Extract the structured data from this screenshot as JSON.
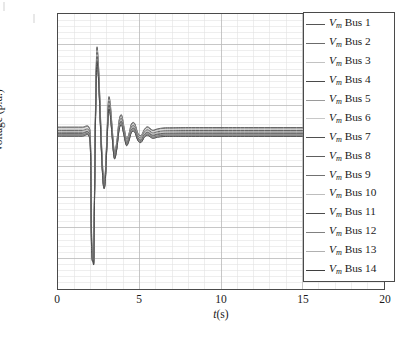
{
  "figure": {
    "background_color": "#ffffff",
    "frame_color": "#4a4a4a",
    "major_grid_color": "#b9b9b9",
    "minor_grid_color": "#e2e2e2"
  },
  "axes": {
    "y": {
      "label": "Voltage (p.u.)",
      "ticks": [
        "0",
        "0.2",
        "0.4",
        "0.6",
        "0.8",
        "1",
        "1.2",
        "1.4",
        "1.6",
        "1.8"
      ],
      "tick_values": [
        0,
        0.2,
        0.4,
        0.6,
        0.8,
        1.0,
        1.2,
        1.4,
        1.6,
        1.8
      ],
      "limits": [
        0,
        1.8
      ],
      "minor_per_major": 5
    },
    "x": {
      "label_prefix": "t",
      "label_suffix": "(s)",
      "ticks": [
        "0",
        "5",
        "10",
        "15",
        "20"
      ],
      "tick_values": [
        0,
        5,
        10,
        15,
        20
      ],
      "limits": [
        0,
        20
      ],
      "minor_per_major": 5
    }
  },
  "legend": {
    "position": "top-right",
    "entries": [
      {
        "label_prefix": "V",
        "label_sub": "m",
        "label_suffix": " Bus 1",
        "color": "#555555"
      },
      {
        "label_prefix": "V",
        "label_sub": "m",
        "label_suffix": " Bus 2",
        "color": "#6b6b6b"
      },
      {
        "label_prefix": "V",
        "label_sub": "m",
        "label_suffix": " Bus 3",
        "color": "#c2c2c2"
      },
      {
        "label_prefix": "V",
        "label_sub": "m",
        "label_suffix": " Bus 4",
        "color": "#4a4a4a"
      },
      {
        "label_prefix": "V",
        "label_sub": "m",
        "label_suffix": " Bus 5",
        "color": "#9a9a9a"
      },
      {
        "label_prefix": "V",
        "label_sub": "m",
        "label_suffix": " Bus 6",
        "color": "#c8c8c8"
      },
      {
        "label_prefix": "V",
        "label_sub": "m",
        "label_suffix": " Bus 7",
        "color": "#4f4f4f"
      },
      {
        "label_prefix": "V",
        "label_sub": "m",
        "label_suffix": " Bus 8",
        "color": "#5e5e5e"
      },
      {
        "label_prefix": "V",
        "label_sub": "m",
        "label_suffix": " Bus 9",
        "color": "#717171"
      },
      {
        "label_prefix": "V",
        "label_sub": "m",
        "label_suffix": " Bus 10",
        "color": "#bdbdbd"
      },
      {
        "label_prefix": "V",
        "label_sub": "m",
        "label_suffix": " Bus 11",
        "color": "#4c4c4c"
      },
      {
        "label_prefix": "V",
        "label_sub": "m",
        "label_suffix": " Bus 12",
        "color": "#808080"
      },
      {
        "label_prefix": "V",
        "label_sub": "m",
        "label_suffix": " Bus 13",
        "color": "#b0b0b0"
      },
      {
        "label_prefix": "V",
        "label_sub": "m",
        "label_suffix": " Bus 14",
        "color": "#3f3f3f"
      }
    ]
  },
  "caption": "",
  "chart_data": {
    "type": "line",
    "title": "",
    "xlabel": "t(s)",
    "ylabel": "Voltage (p.u.)",
    "xlim": [
      0,
      20
    ],
    "ylim": [
      0,
      1.8
    ],
    "grid": true,
    "legend_position": "top-right",
    "event_markers": {
      "fault_start_s": 2.0,
      "fault_clear_s": 2.2,
      "min_voltage_pu": 0.2,
      "max_voltage_pu": 1.61,
      "settling_time_s": 7.0,
      "steady_state_band_pu": [
        1.0,
        1.06
      ],
      "prefault_band_pu": [
        1.01,
        1.07
      ]
    },
    "x": [
      0,
      0.5,
      1.0,
      1.5,
      1.9,
      2.0,
      2.05,
      2.1,
      2.15,
      2.2,
      2.25,
      2.3,
      2.35,
      2.4,
      2.5,
      2.6,
      2.7,
      2.8,
      2.9,
      3.0,
      3.1,
      3.2,
      3.3,
      3.45,
      3.6,
      3.75,
      3.9,
      4.05,
      4.2,
      4.35,
      4.5,
      4.7,
      4.9,
      5.1,
      5.3,
      5.5,
      5.8,
      6.1,
      6.5,
      7.0,
      8.0,
      10.0,
      12.0,
      15.0,
      18.0,
      20.0
    ],
    "series": [
      {
        "name": "V_m Bus 1",
        "color": "#555555",
        "values": [
          1.06,
          1.06,
          1.06,
          1.06,
          1.06,
          0.94,
          0.43,
          0.235,
          0.225,
          0.238,
          0.76,
          1.18,
          1.47,
          1.585,
          1.43,
          1.15,
          0.88,
          0.72,
          0.76,
          1.0,
          1.245,
          1.22,
          1.09,
          0.905,
          0.96,
          1.105,
          1.14,
          1.06,
          0.985,
          1.015,
          1.08,
          1.085,
          1.02,
          1.005,
          1.045,
          1.062,
          1.04,
          1.048,
          1.055,
          1.056,
          1.057,
          1.057,
          1.057,
          1.057,
          1.057,
          1.057
        ]
      },
      {
        "name": "V_m Bus 2",
        "color": "#6b6b6b",
        "values": [
          1.055,
          1.055,
          1.055,
          1.055,
          1.055,
          0.935,
          0.42,
          0.23,
          0.222,
          0.234,
          0.752,
          1.172,
          1.462,
          1.578,
          1.424,
          1.144,
          0.874,
          0.715,
          0.756,
          0.996,
          1.238,
          1.214,
          1.085,
          0.901,
          0.956,
          1.1,
          1.135,
          1.056,
          0.982,
          1.012,
          1.076,
          1.081,
          1.017,
          1.002,
          1.042,
          1.058,
          1.037,
          1.045,
          1.051,
          1.052,
          1.053,
          1.053,
          1.053,
          1.053,
          1.053,
          1.053
        ]
      },
      {
        "name": "V_m Bus 3",
        "color": "#c2c2c2",
        "values": [
          1.045,
          1.045,
          1.045,
          1.045,
          1.045,
          0.922,
          0.4,
          0.222,
          0.215,
          0.226,
          0.735,
          1.155,
          1.445,
          1.56,
          1.408,
          1.13,
          0.862,
          0.704,
          0.746,
          0.986,
          1.225,
          1.2,
          1.074,
          0.893,
          0.948,
          1.09,
          1.124,
          1.047,
          0.975,
          1.005,
          1.067,
          1.072,
          1.009,
          0.996,
          1.034,
          1.049,
          1.029,
          1.036,
          1.042,
          1.043,
          1.044,
          1.044,
          1.044,
          1.044,
          1.044,
          1.044
        ]
      },
      {
        "name": "V_m Bus 4",
        "color": "#4a4a4a",
        "values": [
          1.038,
          1.038,
          1.038,
          1.038,
          1.038,
          0.912,
          0.385,
          0.216,
          0.21,
          0.22,
          0.722,
          1.142,
          1.432,
          1.548,
          1.396,
          1.12,
          0.853,
          0.696,
          0.738,
          0.978,
          1.215,
          1.19,
          1.065,
          0.887,
          0.942,
          1.082,
          1.116,
          1.04,
          0.969,
          0.999,
          1.06,
          1.065,
          1.003,
          0.99,
          1.027,
          1.042,
          1.022,
          1.029,
          1.035,
          1.036,
          1.037,
          1.037,
          1.037,
          1.037,
          1.037,
          1.037
        ]
      },
      {
        "name": "V_m Bus 5",
        "color": "#9a9a9a",
        "values": [
          1.032,
          1.032,
          1.032,
          1.032,
          1.032,
          0.904,
          0.372,
          0.212,
          0.206,
          0.215,
          0.712,
          1.132,
          1.422,
          1.538,
          1.386,
          1.112,
          0.846,
          0.69,
          0.732,
          0.971,
          1.206,
          1.182,
          1.058,
          0.882,
          0.937,
          1.075,
          1.109,
          1.034,
          0.964,
          0.994,
          1.054,
          1.059,
          0.998,
          0.985,
          1.021,
          1.036,
          1.016,
          1.023,
          1.029,
          1.03,
          1.031,
          1.031,
          1.031,
          1.031,
          1.031,
          1.031
        ]
      },
      {
        "name": "V_m Bus 6",
        "color": "#c8c8c8",
        "values": [
          1.027,
          1.027,
          1.027,
          1.027,
          1.027,
          0.897,
          0.362,
          0.208,
          0.202,
          0.211,
          0.704,
          1.124,
          1.414,
          1.53,
          1.378,
          1.105,
          0.84,
          0.685,
          0.727,
          0.965,
          1.199,
          1.175,
          1.052,
          0.877,
          0.932,
          1.069,
          1.103,
          1.029,
          0.96,
          0.99,
          1.049,
          1.054,
          0.993,
          0.981,
          1.016,
          1.031,
          1.011,
          1.018,
          1.024,
          1.025,
          1.026,
          1.026,
          1.026,
          1.026,
          1.026,
          1.026
        ]
      },
      {
        "name": "V_m Bus 7",
        "color": "#4f4f4f",
        "values": [
          1.022,
          1.022,
          1.022,
          1.022,
          1.022,
          0.89,
          0.352,
          0.205,
          0.199,
          0.208,
          0.697,
          1.117,
          1.406,
          1.522,
          1.371,
          1.099,
          0.835,
          0.681,
          0.722,
          0.959,
          1.192,
          1.169,
          1.047,
          0.873,
          0.928,
          1.064,
          1.097,
          1.024,
          0.956,
          0.986,
          1.044,
          1.049,
          0.989,
          0.977,
          1.012,
          1.026,
          1.007,
          1.014,
          1.019,
          1.02,
          1.021,
          1.021,
          1.021,
          1.021,
          1.021,
          1.021
        ]
      },
      {
        "name": "V_m Bus 8",
        "color": "#5e5e5e",
        "values": [
          1.018,
          1.018,
          1.018,
          1.018,
          1.018,
          0.884,
          0.344,
          0.202,
          0.196,
          0.205,
          0.691,
          1.111,
          1.4,
          1.516,
          1.365,
          1.094,
          0.831,
          0.677,
          0.718,
          0.954,
          1.186,
          1.164,
          1.043,
          0.869,
          0.924,
          1.059,
          1.092,
          1.02,
          0.952,
          0.982,
          1.04,
          1.045,
          0.985,
          0.973,
          1.008,
          1.022,
          1.003,
          1.01,
          1.015,
          1.016,
          1.017,
          1.017,
          1.017,
          1.017,
          1.017,
          1.017
        ]
      },
      {
        "name": "V_m Bus 9",
        "color": "#717171",
        "values": [
          1.014,
          1.014,
          1.014,
          1.014,
          1.014,
          0.879,
          0.337,
          0.2,
          0.194,
          0.202,
          0.686,
          1.106,
          1.394,
          1.51,
          1.36,
          1.09,
          0.827,
          0.674,
          0.715,
          0.95,
          1.181,
          1.159,
          1.039,
          0.866,
          0.921,
          1.055,
          1.088,
          1.016,
          0.949,
          0.979,
          1.036,
          1.041,
          0.982,
          0.97,
          1.005,
          1.019,
          0.999,
          1.006,
          1.012,
          1.013,
          1.013,
          1.013,
          1.013,
          1.013,
          1.013,
          1.013
        ]
      },
      {
        "name": "V_m Bus 10",
        "color": "#bdbdbd",
        "values": [
          1.011,
          1.011,
          1.011,
          1.011,
          1.011,
          0.874,
          0.331,
          0.198,
          0.192,
          0.2,
          0.682,
          1.102,
          1.39,
          1.505,
          1.355,
          1.086,
          0.824,
          0.671,
          0.712,
          0.947,
          1.177,
          1.155,
          1.036,
          0.863,
          0.918,
          1.052,
          1.084,
          1.013,
          0.946,
          0.976,
          1.033,
          1.038,
          0.979,
          0.967,
          1.002,
          1.016,
          0.996,
          1.003,
          1.009,
          1.01,
          1.01,
          1.01,
          1.01,
          1.01,
          1.01,
          1.01
        ]
      },
      {
        "name": "V_m Bus 11",
        "color": "#4c4c4c",
        "values": [
          1.008,
          1.008,
          1.008,
          1.008,
          1.008,
          0.87,
          0.326,
          0.196,
          0.19,
          0.198,
          0.678,
          1.098,
          1.386,
          1.501,
          1.351,
          1.083,
          0.821,
          0.669,
          0.71,
          0.944,
          1.174,
          1.152,
          1.033,
          0.861,
          0.916,
          1.049,
          1.081,
          1.01,
          0.944,
          0.974,
          1.03,
          1.035,
          0.977,
          0.965,
          0.999,
          1.013,
          0.993,
          1.0,
          1.006,
          1.007,
          1.007,
          1.007,
          1.007,
          1.007,
          1.007,
          1.007
        ]
      },
      {
        "name": "V_m Bus 12",
        "color": "#808080",
        "values": [
          1.005,
          1.005,
          1.005,
          1.005,
          1.005,
          0.866,
          0.321,
          0.194,
          0.188,
          0.196,
          0.674,
          1.094,
          1.382,
          1.497,
          1.348,
          1.08,
          0.819,
          0.667,
          0.708,
          0.941,
          1.171,
          1.149,
          1.031,
          0.859,
          0.914,
          1.047,
          1.078,
          1.008,
          0.942,
          0.972,
          1.028,
          1.033,
          0.975,
          0.963,
          0.997,
          1.011,
          0.991,
          0.998,
          1.003,
          1.004,
          1.004,
          1.004,
          1.004,
          1.004,
          1.004,
          1.004
        ]
      },
      {
        "name": "V_m Bus 13",
        "color": "#b0b0b0",
        "values": [
          1.002,
          1.002,
          1.002,
          1.002,
          1.002,
          0.862,
          0.317,
          0.193,
          0.187,
          0.194,
          0.671,
          1.09,
          1.378,
          1.493,
          1.345,
          1.077,
          0.816,
          0.665,
          0.706,
          0.939,
          1.168,
          1.146,
          1.028,
          0.857,
          0.912,
          1.044,
          1.076,
          1.005,
          0.94,
          0.97,
          1.025,
          1.03,
          0.973,
          0.961,
          0.995,
          1.008,
          0.988,
          0.995,
          1.0,
          1.001,
          1.001,
          1.001,
          1.001,
          1.001,
          1.001,
          1.001
        ]
      },
      {
        "name": "V_m Bus 14",
        "color": "#3f3f3f",
        "values": [
          1.0,
          1.0,
          1.0,
          1.0,
          1.0,
          0.858,
          0.313,
          0.192,
          0.186,
          0.193,
          0.668,
          1.087,
          1.375,
          1.49,
          1.342,
          1.075,
          0.814,
          0.663,
          0.704,
          0.937,
          1.165,
          1.143,
          1.026,
          0.855,
          0.91,
          1.042,
          1.074,
          1.003,
          0.938,
          0.968,
          1.023,
          1.028,
          0.971,
          0.959,
          0.993,
          1.006,
          0.986,
          0.993,
          0.998,
          0.999,
          0.999,
          0.999,
          0.999,
          0.999,
          0.999,
          0.999
        ]
      }
    ]
  }
}
